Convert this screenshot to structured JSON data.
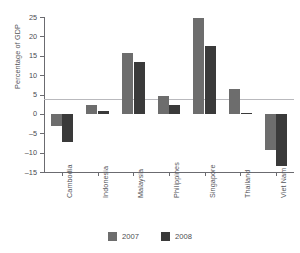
{
  "chart_data": {
    "type": "bar",
    "title": "",
    "xlabel": "",
    "ylabel": "Percentage of GDP",
    "ylim": [
      -15,
      25
    ],
    "yticks": [
      25,
      20,
      15,
      10,
      5,
      0,
      -5,
      -10,
      -15
    ],
    "grid": false,
    "legend_position": "bottom-center",
    "categories": [
      "Cambodia",
      "Indonesia",
      "Malaysia",
      "Philippines",
      "Singapore",
      "Thailand",
      "Viet Nam"
    ],
    "series": [
      {
        "name": "2007",
        "color": "#6d6d6d",
        "values": [
          -3.0,
          2.4,
          15.7,
          4.7,
          24.7,
          6.3,
          -9.4
        ]
      },
      {
        "name": "2008",
        "color": "#3a3a3a",
        "values": [
          -7.3,
          0.7,
          13.4,
          2.2,
          17.5,
          0.2,
          -13.5
        ]
      }
    ]
  }
}
